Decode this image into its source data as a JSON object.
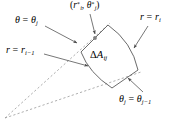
{
  "figure": {
    "type": "polar-grid-cell-diagram",
    "colors": {
      "stroke": "#555555",
      "dashed": "#888888",
      "text": "#000000",
      "background": "#ffffff",
      "marker": "#777777"
    },
    "labels": {
      "sample_point": {
        "text": "(r*_i, θ*_j)",
        "parts": {
          "open": "(",
          "r": "r",
          "r_star": "*",
          "r_sub": "i",
          "comma": ", ",
          "theta": "θ",
          "theta_star": "*",
          "theta_sub": "j",
          "close": ")"
        }
      },
      "theta_upper": {
        "text": "θ = θ_j",
        "parts": {
          "lhs": "θ",
          "eq": " = ",
          "rhs": "θ",
          "sub": "j"
        }
      },
      "r_outer": {
        "text": "r = r_i",
        "parts": {
          "lhs": "r",
          "eq": " = ",
          "rhs": "r",
          "sub": "i"
        }
      },
      "r_inner": {
        "text": "r = r_{i-1}",
        "parts": {
          "lhs": "r",
          "eq": " = ",
          "rhs": "r",
          "sub": "i−1"
        }
      },
      "area_element": {
        "text": "ΔA_ij",
        "parts": {
          "delta": "Δ",
          "a": "A",
          "sub": "ij"
        }
      },
      "theta_lower": {
        "text": "θ_j = θ_{j-1}",
        "parts": {
          "lhs": "θ",
          "lhs_sub": "j",
          "eq": " = ",
          "rhs": "θ",
          "rhs_sub": "j−1"
        }
      }
    },
    "geometry": {
      "origin": [
        5,
        118
      ],
      "cell_corners": {
        "outer_upper": [
          108,
          25
        ],
        "outer_lower": [
          138,
          70
        ],
        "inner_lower": [
          112,
          88
        ],
        "inner_upper": [
          81,
          52
        ]
      },
      "sample_point_marker": [
        95,
        38
      ]
    }
  }
}
